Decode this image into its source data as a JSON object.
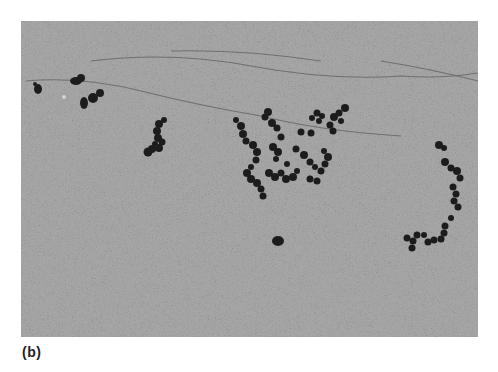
{
  "figure": {
    "panel_label": "(b)",
    "image_description": "Electron micrograph showing beaded chains of dark particles on a grainy grey background",
    "colors": {
      "background": "#ffffff",
      "field": "#9a9a9a",
      "particles": "#1c1c1c",
      "strands": "#4a4a4a"
    }
  }
}
